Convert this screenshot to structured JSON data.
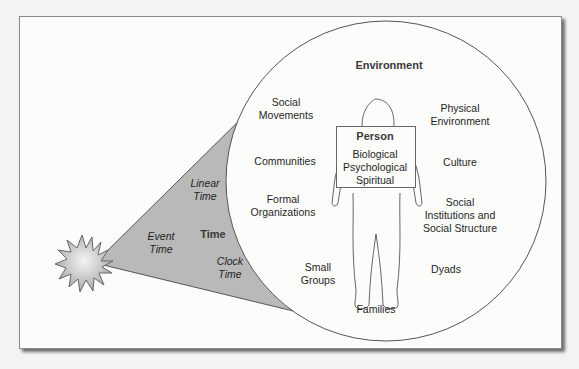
{
  "diagram": {
    "center_title": "Environment",
    "person": {
      "title": "Person",
      "dimensions": [
        "Biological",
        "Psychological",
        "Spiritual"
      ]
    },
    "environment_labels": {
      "social_movements": [
        "Social",
        "Movements"
      ],
      "physical_environment": [
        "Physical",
        "Environment"
      ],
      "communities": "Communities",
      "culture": "Culture",
      "formal_organizations": [
        "Formal",
        "Organizations"
      ],
      "social_institutions": [
        "Social",
        "Institutions and",
        "Social Structure"
      ],
      "small_groups": [
        "Small",
        "Groups"
      ],
      "dyads": "Dyads",
      "families": "Families"
    },
    "time_labels": {
      "time": "Time",
      "linear_time": [
        "Linear",
        "Time"
      ],
      "event_time": [
        "Event",
        "Time"
      ],
      "clock_time": [
        "Clock",
        "Time"
      ]
    },
    "colors": {
      "cone_fill": "#b9b9b9",
      "burst_fill": "#c4c4c4",
      "line": "#555555",
      "text": "#1f1f1f"
    }
  }
}
